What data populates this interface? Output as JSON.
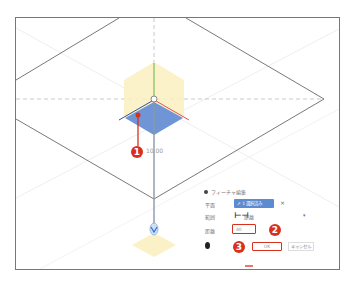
{
  "viewport": {
    "dimension_label": "10.00"
  },
  "callouts": [
    {
      "number": "1",
      "target": "plane-face"
    },
    {
      "number": "2",
      "target": "distance-input"
    },
    {
      "number": "3",
      "target": "ok-button"
    }
  ],
  "dialog": {
    "title": "フィーチャ編集",
    "rows": {
      "plane_label": "平面",
      "plane_value": "1 選択済み",
      "extent_label": "範囲",
      "extent_value": "距離",
      "distance_label": "距離",
      "distance_value": "40"
    },
    "ok_label": "OK",
    "cancel_label": "キャンセル",
    "clear_icon": "×",
    "dropdown_icon": "▾"
  },
  "colors": {
    "callout": "#d9301b",
    "plane_face": "#6f95d6",
    "gizmo_hex": "#fbf0c0",
    "axis_x": "#e05050",
    "axis_y": "#6ab04c",
    "axis_z": "#3050a0"
  }
}
